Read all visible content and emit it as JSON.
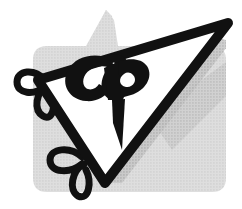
{
  "artwork": {
    "kind": "logo-mark",
    "title": "CP monogram triangle logo",
    "monogram_text": "CP",
    "background_panel": {
      "name": "gray-halftone-panel",
      "fill": "#d9d9d9",
      "corner_radius": 14,
      "left": 33,
      "top": 10,
      "right": 226,
      "bottom": 192,
      "peak_x": 106,
      "peak_y": 10,
      "notch_left_y": 46,
      "texture": "halftone-dots"
    },
    "shadow_band": {
      "name": "drop-shadow-band",
      "fill": "#bcbcbc"
    },
    "triangle": {
      "name": "outlined-triangle",
      "outline_color": "#111111",
      "fill_color": "#ffffff",
      "stroke_width": 10,
      "vertices": [
        {
          "x": 38,
          "y": 80
        },
        {
          "x": 228,
          "y": 23
        },
        {
          "x": 105,
          "y": 183
        }
      ]
    },
    "letters": {
      "fill": "#111111",
      "c_label": "C",
      "p_label": "P"
    },
    "ribbon_loops": {
      "name": "ribbon-loop-decoration",
      "stroke_color": "#111111",
      "stroke_width": 7,
      "count": 5
    }
  }
}
